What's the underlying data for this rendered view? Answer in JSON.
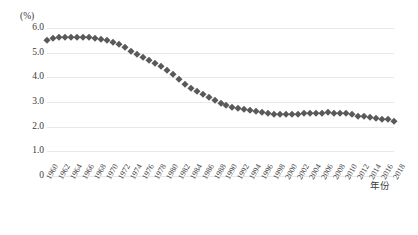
{
  "chart_data": {
    "type": "scatter",
    "title": "",
    "subtitle": "",
    "xlabel": "年份",
    "ylabel": "(%)",
    "ylim": [
      0,
      6.0
    ],
    "yticks": [
      "0",
      "1.0",
      "2.0",
      "3.0",
      "4.0",
      "5.0",
      "6.0"
    ],
    "ytick_values": [
      0,
      1.0,
      2.0,
      3.0,
      4.0,
      5.0,
      6.0
    ],
    "grid": true,
    "legend": "none",
    "marker": "diamond",
    "marker_color": "#595959",
    "x": [
      1960,
      1961,
      1962,
      1963,
      1964,
      1965,
      1966,
      1967,
      1968,
      1969,
      1970,
      1971,
      1972,
      1973,
      1974,
      1975,
      1976,
      1977,
      1978,
      1979,
      1980,
      1981,
      1982,
      1983,
      1984,
      1985,
      1986,
      1987,
      1988,
      1989,
      1990,
      1991,
      1992,
      1993,
      1994,
      1995,
      1996,
      1997,
      1998,
      1999,
      2000,
      2001,
      2002,
      2003,
      2004,
      2005,
      2006,
      2007,
      2008,
      2009,
      2010,
      2011,
      2012,
      2013,
      2014,
      2015,
      2016,
      2017,
      2018
    ],
    "values": [
      5.53,
      5.58,
      5.62,
      5.64,
      5.65,
      5.65,
      5.64,
      5.62,
      5.6,
      5.57,
      5.53,
      5.45,
      5.35,
      5.22,
      5.08,
      4.95,
      4.82,
      4.7,
      4.58,
      4.45,
      4.3,
      4.15,
      3.95,
      3.72,
      3.55,
      3.43,
      3.32,
      3.2,
      3.08,
      2.97,
      2.88,
      2.8,
      2.74,
      2.7,
      2.66,
      2.62,
      2.58,
      2.55,
      2.53,
      2.52,
      2.52,
      2.52,
      2.53,
      2.54,
      2.55,
      2.56,
      2.57,
      2.58,
      2.57,
      2.56,
      2.55,
      2.5,
      2.45,
      2.42,
      2.39,
      2.36,
      2.33,
      2.3,
      2.25
    ],
    "xtick_labels": [
      "1960",
      "1962",
      "1964",
      "1966",
      "1968",
      "1970",
      "1972",
      "1974",
      "1976",
      "1978",
      "1980",
      "1982",
      "1984",
      "1986",
      "1988",
      "1990",
      "1992",
      "1994",
      "1996",
      "1998",
      "2000",
      "2002",
      "2004",
      "2006",
      "2008",
      "2010",
      "2012",
      "2014",
      "2016",
      "2018"
    ],
    "xtick_values": [
      1960,
      1962,
      1964,
      1966,
      1968,
      1970,
      1972,
      1974,
      1976,
      1978,
      1980,
      1982,
      1984,
      1986,
      1988,
      1990,
      1992,
      1994,
      1996,
      1998,
      2000,
      2002,
      2004,
      2006,
      2008,
      2010,
      2012,
      2014,
      2016,
      2018
    ]
  }
}
